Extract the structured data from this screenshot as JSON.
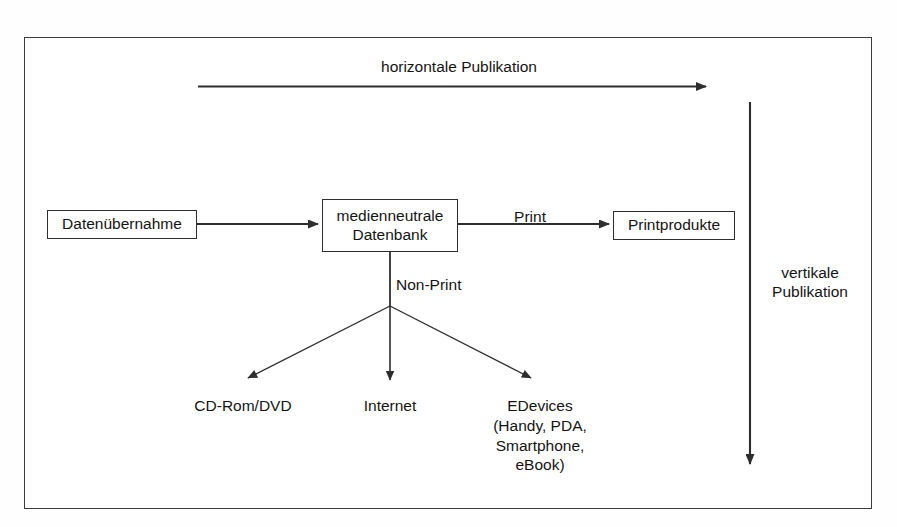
{
  "diagram": {
    "frame": {
      "border_color": "#3b3b3b",
      "background": "#ffffff"
    },
    "line_color": "#2e2e2e",
    "text_color": "#141414"
  },
  "axes": {
    "horizontal": {
      "label": "horizontale Publikation",
      "direction": "left-to-right"
    },
    "vertical": {
      "label": "vertikale\nPublikation",
      "direction": "top-to-bottom"
    }
  },
  "nodes": {
    "source": {
      "label": "Datenübernahme"
    },
    "database": {
      "label": "medienneutrale\nDatenbank"
    },
    "print_output": {
      "label": "Printprodukte"
    }
  },
  "edge_labels": {
    "print": "Print",
    "non_print": "Non-Print"
  },
  "leaves": [
    {
      "label": "CD-Rom/DVD"
    },
    {
      "label": "Internet"
    },
    {
      "label": "EDevices\n(Handy, PDA,\nSmartphone,\neBook)"
    }
  ]
}
